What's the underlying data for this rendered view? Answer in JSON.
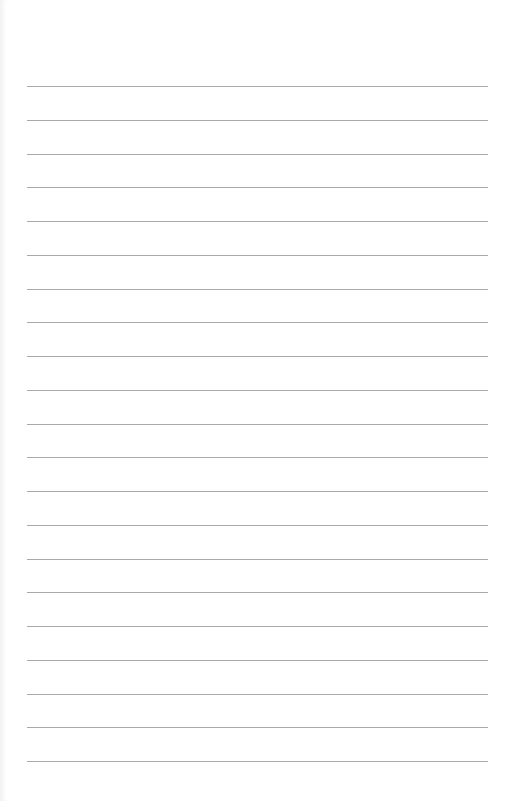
{
  "paper": {
    "type": "lined-notebook-page",
    "line_count": 21,
    "first_line_y": 86,
    "line_spacing": 33.75,
    "line_left": 27,
    "line_right": 488,
    "line_color": "#a9a9a9",
    "background_color": "#ffffff"
  }
}
